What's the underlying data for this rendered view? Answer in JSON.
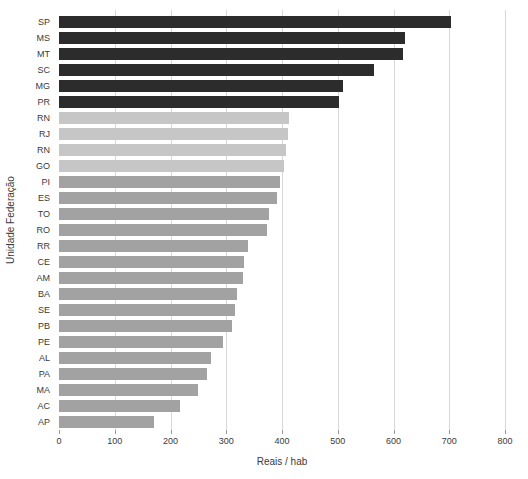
{
  "chart_data": {
    "type": "bar",
    "orientation": "horizontal",
    "title": "",
    "xlabel": "Reais / hab",
    "ylabel": "Unidade Federação",
    "categories": [
      "SP",
      "MS",
      "MT",
      "SC",
      "MG",
      "PR",
      "RN",
      "RJ",
      "RN",
      "GO",
      "PI",
      "ES",
      "TO",
      "RO",
      "RR",
      "CE",
      "AM",
      "BA",
      "SE",
      "PB",
      "PE",
      "AL",
      "PA",
      "MA",
      "AC",
      "AP"
    ],
    "values": [
      703,
      620,
      617,
      565,
      510,
      503,
      413,
      411,
      408,
      404,
      396,
      391,
      377,
      373,
      339,
      331,
      330,
      319,
      316,
      311,
      294,
      273,
      265,
      250,
      217,
      171
    ],
    "xlim": [
      0,
      800
    ],
    "xticks": [
      0,
      100,
      200,
      300,
      400,
      500,
      600,
      700,
      800
    ],
    "grid": true,
    "legend": false,
    "colors": {
      "dark_bar": "#2c2c2c",
      "light_bar": "#c6c6c6",
      "medium_bar": "#a2a2a2",
      "gridline": "#d8d8d8",
      "tick": "#9a9a9a",
      "text": "#3a3a3a",
      "background": "#ffffff"
    },
    "color_groups": [
      {
        "start_index": 0,
        "end_index": 5,
        "color_key": "dark_bar"
      },
      {
        "start_index": 6,
        "end_index": 9,
        "color_key": "light_bar"
      },
      {
        "start_index": 10,
        "end_index": 25,
        "color_key": "medium_bar"
      }
    ]
  }
}
